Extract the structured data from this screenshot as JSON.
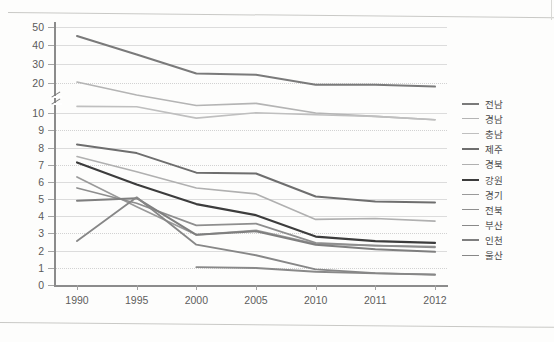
{
  "chart_data": {
    "type": "line",
    "title": "",
    "xlabel": "",
    "ylabel": "",
    "grid": true,
    "legend_position": "right",
    "axis_break": {
      "between": [
        10,
        20
      ],
      "marker": "//"
    },
    "categories": [
      "1990",
      "1995",
      "2000",
      "2005",
      "2010",
      "2011",
      "2012"
    ],
    "ytick_labels": [
      "50",
      "40",
      "30",
      "20",
      "10",
      "9",
      "8",
      "7",
      "6",
      "5",
      "4",
      "3",
      "2",
      "1",
      "0"
    ],
    "ytick_values": [
      50,
      40,
      30,
      20,
      10,
      9,
      8,
      7,
      6,
      5,
      4,
      3,
      2,
      1,
      0
    ],
    "series": [
      {
        "name": "전남",
        "color": "#7a7a7a",
        "width": 2.0,
        "values": [
          45.0,
          35.0,
          25.0,
          24.3,
          19.4,
          19.4,
          18.8
        ]
      },
      {
        "name": "경남",
        "color": "#b4b4b4",
        "width": 1.6,
        "values": [
          20.5,
          16.0,
          12.5,
          13.2,
          10.0,
          9.8,
          9.6
        ]
      },
      {
        "name": "충남",
        "color": "#bfbfbf",
        "width": 1.6,
        "values": [
          12.2,
          12.1,
          9.7,
          10.1,
          9.9,
          9.8,
          9.6
        ]
      },
      {
        "name": "제주",
        "color": "#6e6e6e",
        "width": 2.0,
        "values": [
          8.2,
          7.7,
          6.55,
          6.5,
          5.15,
          4.85,
          4.8
        ]
      },
      {
        "name": "경북",
        "color": "#b0b0b0",
        "width": 1.6,
        "values": [
          7.5,
          6.6,
          5.65,
          5.3,
          3.8,
          3.85,
          3.7
        ]
      },
      {
        "name": "강원",
        "color": "#3c3c3c",
        "width": 2.1,
        "values": [
          7.15,
          5.85,
          4.7,
          4.05,
          2.8,
          2.55,
          2.45
        ]
      },
      {
        "name": "경기",
        "color": "#9a9a9a",
        "width": 1.7,
        "values": [
          6.3,
          4.55,
          2.9,
          3.15,
          2.4,
          2.3,
          2.25
        ]
      },
      {
        "name": "전북",
        "color": "#8e8e8e",
        "width": 1.7,
        "values": [
          5.65,
          4.75,
          3.45,
          3.55,
          2.45,
          2.3,
          2.2
        ]
      },
      {
        "name": "부산",
        "color": "#898989",
        "width": 1.8,
        "values": [
          null,
          null,
          1.05,
          1.0,
          0.78,
          0.68,
          0.62
        ]
      },
      {
        "name": "인천",
        "color": "#7f7f7f",
        "width": 2.0,
        "values": [
          4.9,
          5.05,
          2.9,
          3.1,
          2.35,
          2.1,
          1.95
        ]
      },
      {
        "name": "울산",
        "color": "#878787",
        "width": 1.8,
        "values": [
          2.55,
          5.1,
          2.35,
          1.75,
          0.92,
          0.7,
          0.6
        ]
      }
    ]
  },
  "legend": {
    "items": [
      {
        "label": "전남"
      },
      {
        "label": "경남"
      },
      {
        "label": "충남"
      },
      {
        "label": "제주"
      },
      {
        "label": "경북"
      },
      {
        "label": "강원"
      },
      {
        "label": "경기"
      },
      {
        "label": "전북"
      },
      {
        "label": "부산"
      },
      {
        "label": "인천"
      },
      {
        "label": "울산"
      }
    ]
  }
}
